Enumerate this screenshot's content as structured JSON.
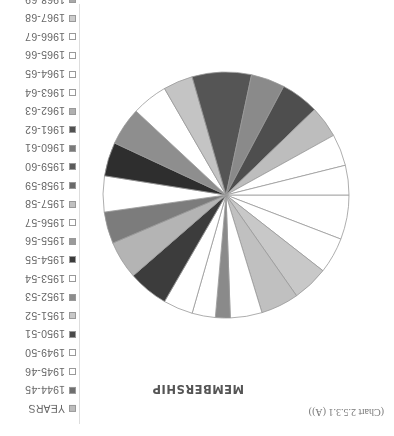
{
  "caption": "(Chart 2.5.3.1 (A))",
  "title": "MEMBERSHIP",
  "legend": [
    {
      "label": "YEARS",
      "color": "#bdbdbd"
    },
    {
      "label": "1944-45",
      "color": "#6e6e6e"
    },
    {
      "label": "1945-46",
      "color": "#ffffff"
    },
    {
      "label": "1949-50",
      "color": "#ffffff"
    },
    {
      "label": "1950-51",
      "color": "#4a4a4a"
    },
    {
      "label": "1951-52",
      "color": "#c8c8c8"
    },
    {
      "label": "1952-53",
      "color": "#8c8c8c"
    },
    {
      "label": "1953-54",
      "color": "#ffffff"
    },
    {
      "label": "1954-55",
      "color": "#3a3a3a"
    },
    {
      "label": "1955-56",
      "color": "#9a9a9a"
    },
    {
      "label": "1956-57",
      "color": "#ffffff"
    },
    {
      "label": "1957-58",
      "color": "#c0c0c0"
    },
    {
      "label": "1958-59",
      "color": "#6a6a6a"
    },
    {
      "label": "1959-60",
      "color": "#5a5a5a"
    },
    {
      "label": "1960-61",
      "color": "#7a7a7a"
    },
    {
      "label": "1961-62",
      "color": "#505050"
    },
    {
      "label": "1962-63",
      "color": "#b0b0b0"
    },
    {
      "label": "1963-64",
      "color": "#ffffff"
    },
    {
      "label": "1964-65",
      "color": "#ffffff"
    },
    {
      "label": "1965-66",
      "color": "#ffffff"
    },
    {
      "label": "1966-67",
      "color": "#ffffff"
    },
    {
      "label": "1967-68",
      "color": "#cccccc"
    },
    {
      "label": "1968-69",
      "color": "#a8a8a8"
    },
    {
      "label": "1969-70",
      "color": "#ffffff"
    }
  ],
  "chart_data": {
    "type": "pie",
    "title": "MEMBERSHIP",
    "caption": "(Chart 2.5.3.1 (A))",
    "legend_position": "right",
    "categories": [
      "1944-45",
      "1945-46",
      "1949-50",
      "1950-51",
      "1951-52",
      "1952-53",
      "1953-54",
      "1954-55",
      "1955-56",
      "1956-57",
      "1957-58",
      "1958-59",
      "1959-60",
      "1960-61",
      "1961-62",
      "1962-63",
      "1963-64",
      "1964-65",
      "1965-66",
      "1966-67",
      "1967-68",
      "1968-69",
      "1969-70"
    ],
    "slices_deg": [
      {
        "start": 0,
        "end": 21,
        "color": "#ffffff"
      },
      {
        "start": 21,
        "end": 38,
        "color": "#ffffff"
      },
      {
        "start": 38,
        "end": 55,
        "color": "#c8c8c8"
      },
      {
        "start": 55,
        "end": 73,
        "color": "#c0c0c0"
      },
      {
        "start": 73,
        "end": 88,
        "color": "#ffffff"
      },
      {
        "start": 88,
        "end": 95,
        "color": "#8a8a8a"
      },
      {
        "start": 95,
        "end": 106,
        "color": "#ffffff"
      },
      {
        "start": 106,
        "end": 120,
        "color": "#ffffff"
      },
      {
        "start": 120,
        "end": 139,
        "color": "#3c3c3c"
      },
      {
        "start": 139,
        "end": 157,
        "color": "#b4b4b4"
      },
      {
        "start": 157,
        "end": 172,
        "color": "#7c7c7c"
      },
      {
        "start": 172,
        "end": 189,
        "color": "#ffffff"
      },
      {
        "start": 189,
        "end": 205,
        "color": "#2e2e2e"
      },
      {
        "start": 205,
        "end": 223,
        "color": "#8e8e8e"
      },
      {
        "start": 223,
        "end": 240,
        "color": "#ffffff"
      },
      {
        "start": 240,
        "end": 254,
        "color": "#c4c4c4"
      },
      {
        "start": 254,
        "end": 282,
        "color": "#555555"
      },
      {
        "start": 282,
        "end": 298,
        "color": "#8a8a8a"
      },
      {
        "start": 298,
        "end": 316,
        "color": "#4e4e4e"
      },
      {
        "start": 316,
        "end": 331,
        "color": "#bdbdbd"
      },
      {
        "start": 331,
        "end": 346,
        "color": "#ffffff"
      },
      {
        "start": 346,
        "end": 360,
        "color": "#ffffff"
      }
    ]
  }
}
